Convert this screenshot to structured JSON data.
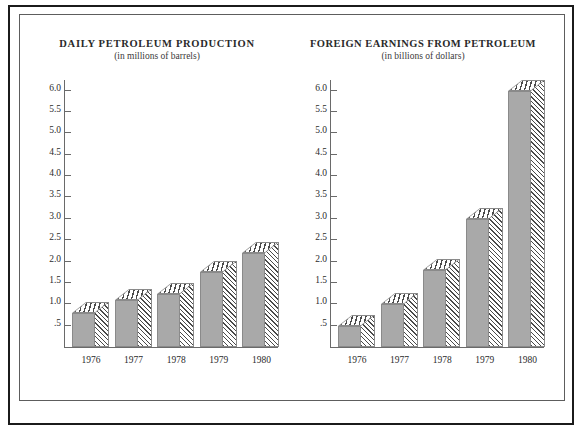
{
  "chart_data": [
    {
      "type": "bar",
      "title": "DAILY PETROLEUM PRODUCTION",
      "subtitle": "(in millions of barrels)",
      "xlabel": "",
      "ylabel": "",
      "categories": [
        "1976",
        "1977",
        "1978",
        "1979",
        "1980"
      ],
      "values": [
        0.8,
        1.1,
        1.25,
        1.75,
        2.2
      ],
      "ylim": [
        0,
        6.25
      ],
      "yticks": [
        0.5,
        1.0,
        1.5,
        2.0,
        2.5,
        3.0,
        3.5,
        4.0,
        4.5,
        5.0,
        5.5,
        6.0
      ],
      "ytick_labels": [
        ".5",
        "1.0",
        "1.5",
        "2.0",
        "2.5",
        "3.0",
        "3.5",
        "4.0",
        "4.5",
        "5.0",
        "5.5",
        "6.0"
      ],
      "grid": false,
      "legend": "none",
      "bar_style": "3d-isometric-hatched",
      "bar_face_color": "#a9a9a9",
      "bar_hatch_color": "#4a4a4a"
    },
    {
      "type": "bar",
      "title": "FOREIGN EARNINGS FROM PETROLEUM",
      "subtitle": "(in billions of dollars)",
      "xlabel": "",
      "ylabel": "",
      "categories": [
        "1976",
        "1977",
        "1978",
        "1979",
        "1980"
      ],
      "values": [
        0.5,
        1.0,
        1.8,
        3.0,
        6.0
      ],
      "ylim": [
        0,
        6.25
      ],
      "yticks": [
        0.5,
        1.0,
        1.5,
        2.0,
        2.5,
        3.0,
        3.5,
        4.0,
        4.5,
        5.0,
        5.5,
        6.0
      ],
      "ytick_labels": [
        ".5",
        "1.0",
        "1.5",
        "2.0",
        "2.5",
        "3.0",
        "3.5",
        "4.0",
        "4.5",
        "5.0",
        "5.5",
        "6.0"
      ],
      "grid": false,
      "legend": "none",
      "bar_style": "3d-isometric-hatched",
      "bar_face_color": "#a9a9a9",
      "bar_hatch_color": "#4a4a4a"
    }
  ]
}
